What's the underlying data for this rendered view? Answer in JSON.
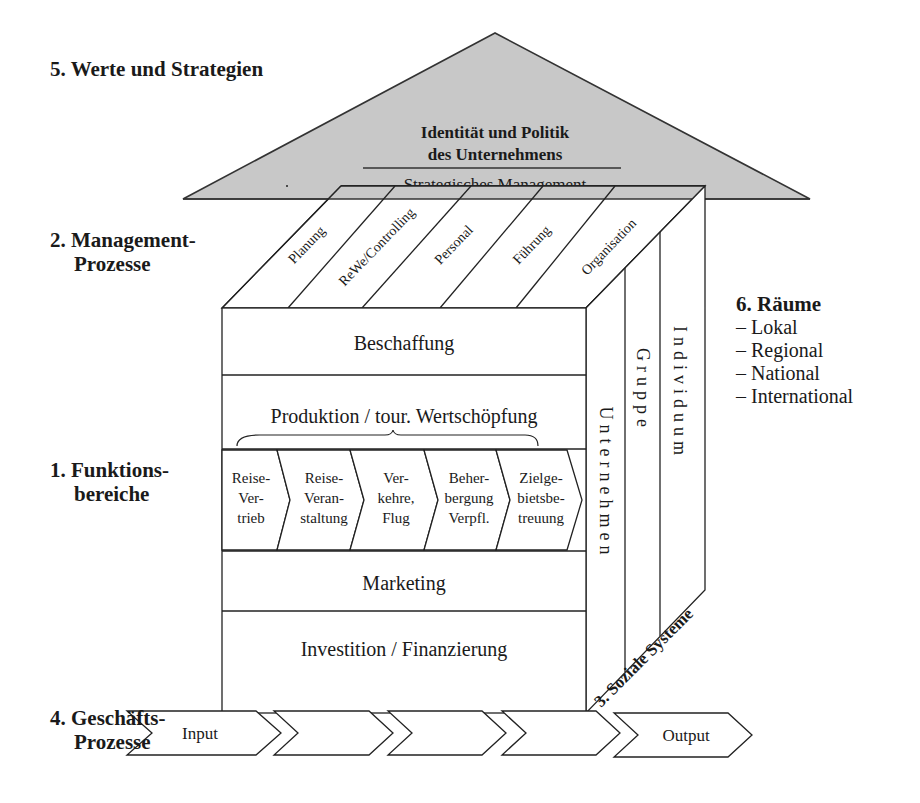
{
  "sections": {
    "werte": {
      "number": "5.",
      "title": "Werte und Strategien"
    },
    "management": {
      "number": "2.",
      "title_line1": "Management-",
      "title_line2": "Prozesse"
    },
    "funktion": {
      "number": "1.",
      "title_line1": "Funktions-",
      "title_line2": "bereiche"
    },
    "geschaeft": {
      "number": "4.",
      "title_line1": "Geschäfts-",
      "title_line2": "Prozesse"
    },
    "soziale": {
      "label": "3. Soziale Systeme"
    },
    "raeume": {
      "number": "6.",
      "title": "Räume",
      "items": [
        "– Lokal",
        "– Regional",
        "– National",
        "– International"
      ]
    }
  },
  "roof": {
    "line1": "Identität und Politik",
    "line2": "des Unternehmens",
    "line3": "Strategisches Management",
    "fill": "#c8c8c8"
  },
  "management_processes": [
    "Planung",
    "ReWe/Controlling",
    "Personal",
    "Führung",
    "Organisation"
  ],
  "function_areas": {
    "beschaffung": "Beschaffung",
    "produktion": "Produktion / tour. Wertschöpfung",
    "chain": [
      {
        "line1": "Reise-",
        "line2": "Ver-",
        "line3": "trieb"
      },
      {
        "line1": "Reise-",
        "line2": "Veran-",
        "line3": "staltung"
      },
      {
        "line1": "Ver-",
        "line2": "kehre,",
        "line3": "Flug"
      },
      {
        "line1": "Beher-",
        "line2": "bergung",
        "line3": "Verpfl."
      },
      {
        "line1": "Zielge-",
        "line2": "bietsbe-",
        "line3": "treuung"
      }
    ],
    "marketing": "Marketing",
    "investition": "Investition / Finanzierung"
  },
  "social_systems": [
    "Unternehmen",
    "Gruppe",
    "Individuum"
  ],
  "business_process_chain": [
    "Input",
    "",
    "",
    "",
    "Output"
  ]
}
